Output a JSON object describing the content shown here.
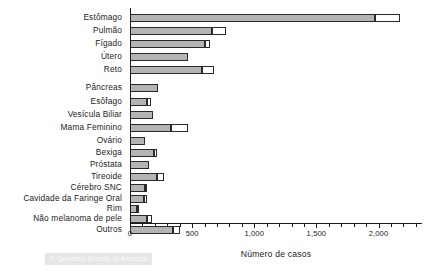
{
  "chart_data": {
    "type": "bar",
    "orientation": "horizontal",
    "stacked": true,
    "title": "",
    "xlabel": "Número de casos",
    "ylabel": "",
    "xlim": [
      0,
      2350
    ],
    "grid": false,
    "legend": null,
    "xticks": [
      0,
      500,
      1000,
      1500,
      2000
    ],
    "xticklabels": [
      "0",
      "500",
      "1,000",
      "1,500",
      "2,000"
    ],
    "minor_tick_interval": 100,
    "categories": [
      "Estômago",
      "Pulmão",
      "Fígado",
      "Útero",
      "Reto",
      "Pâncreas",
      "Esôfago",
      "Vesícula Biliar",
      "Mama Feminino",
      "Ovário",
      "Bexiga",
      "Próstata",
      "Tireoide",
      "Cérebro SNC",
      "Cavidade da Faringe Oral",
      "Rim",
      "Não melanoma de pele",
      "Outros"
    ],
    "series": [
      {
        "name": "filled",
        "color": "#b4b4b4",
        "values": [
          1975,
          660,
          600,
          470,
          580,
          225,
          140,
          185,
          330,
          120,
          190,
          150,
          215,
          120,
          115,
          60,
          135,
          345
        ]
      },
      {
        "name": "open",
        "color": "#ffffff",
        "values": [
          200,
          115,
          45,
          0,
          95,
          0,
          30,
          0,
          140,
          0,
          25,
          0,
          60,
          15,
          20,
          15,
          45,
          60
        ]
      }
    ],
    "totals": [
      2175,
      775,
      645,
      470,
      675,
      225,
      170,
      185,
      470,
      120,
      215,
      150,
      275,
      135,
      135,
      75,
      180,
      405
    ],
    "watermark": "© Genetics Society of America"
  }
}
